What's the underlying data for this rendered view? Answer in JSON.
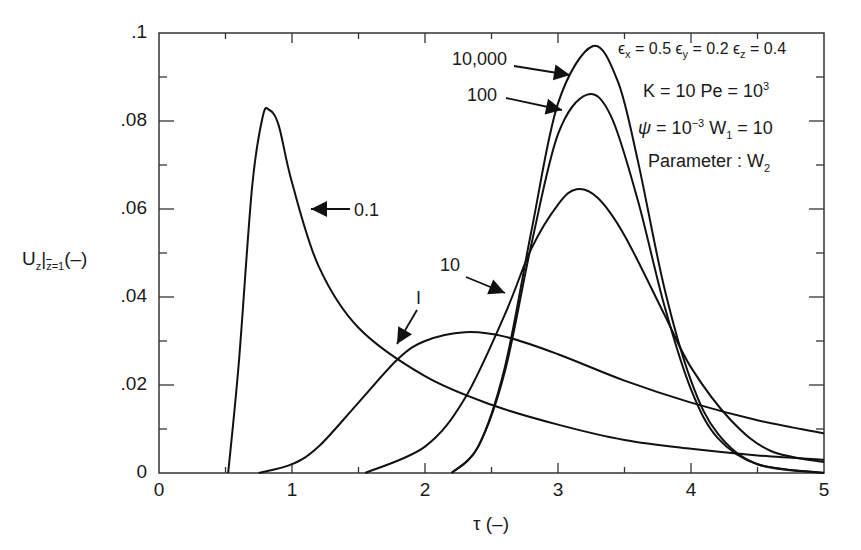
{
  "chart_data": {
    "type": "line",
    "title": "",
    "xlabel": "τ (–)",
    "ylabel": "U_z|_{z̄=1} (–)",
    "xlim": [
      0,
      5
    ],
    "ylim": [
      0,
      0.1
    ],
    "grid": false,
    "legend": "none (inline curve labels with arrows)",
    "x_ticks": [
      "0",
      "1",
      "2",
      "3",
      "4",
      "5"
    ],
    "y_ticks": [
      "0",
      ".02",
      ".04",
      ".06",
      ".08",
      ".1"
    ],
    "parameter": "W2",
    "annotations": [
      "εx = 0.5  εy = 0.2  εz = 0.4",
      "K = 10  Pe = 10^3",
      "ψ = 10^-3  W1 = 10",
      "Parameter : W2"
    ],
    "series": [
      {
        "name": "0.1",
        "x": [
          0.52,
          0.6,
          0.7,
          0.78,
          0.83,
          0.9,
          1.0,
          1.2,
          1.5,
          2.0,
          2.5,
          3.0,
          3.5,
          4.0,
          4.5,
          5.0
        ],
        "y": [
          0,
          0.025,
          0.065,
          0.081,
          0.0825,
          0.079,
          0.066,
          0.047,
          0.033,
          0.022,
          0.0155,
          0.011,
          0.0075,
          0.0055,
          0.004,
          0.003
        ]
      },
      {
        "name": "1",
        "x": [
          0.75,
          1.0,
          1.2,
          1.5,
          1.8,
          2.0,
          2.3,
          2.6,
          3.0,
          3.5,
          4.0,
          4.5,
          5.0
        ],
        "y": [
          0,
          0.002,
          0.006,
          0.016,
          0.026,
          0.03,
          0.032,
          0.031,
          0.027,
          0.021,
          0.016,
          0.012,
          0.009
        ]
      },
      {
        "name": "10",
        "x": [
          1.55,
          2.0,
          2.3,
          2.6,
          2.8,
          3.0,
          3.14,
          3.3,
          3.5,
          3.8,
          4.0,
          4.3,
          4.6,
          5.0
        ],
        "y": [
          0,
          0.006,
          0.017,
          0.036,
          0.051,
          0.061,
          0.0645,
          0.0625,
          0.054,
          0.036,
          0.024,
          0.012,
          0.005,
          0.0025
        ]
      },
      {
        "name": "100",
        "x": [
          2.2,
          2.4,
          2.6,
          2.8,
          3.0,
          3.22,
          3.4,
          3.6,
          3.8,
          4.0,
          4.2,
          4.5,
          5.0
        ],
        "y": [
          0,
          0.006,
          0.023,
          0.052,
          0.077,
          0.086,
          0.081,
          0.062,
          0.038,
          0.019,
          0.008,
          0.002,
          0
        ]
      },
      {
        "name": "10,000",
        "x": [
          2.2,
          2.4,
          2.6,
          2.8,
          3.0,
          3.26,
          3.45,
          3.6,
          3.8,
          4.0,
          4.2,
          4.5,
          5.0
        ],
        "y": [
          0,
          0.006,
          0.024,
          0.055,
          0.084,
          0.097,
          0.089,
          0.071,
          0.042,
          0.021,
          0.009,
          0.002,
          0
        ]
      }
    ]
  },
  "labels": {
    "annot_eps": "ϵx = 0.5 ϵy = 0.2 ϵz = 0.4",
    "annot_k": "K = 10 Pe = 10³",
    "annot_psi": "ψ = 10⁻³ W₁ = 10",
    "annot_param": "Parameter : W₂"
  }
}
